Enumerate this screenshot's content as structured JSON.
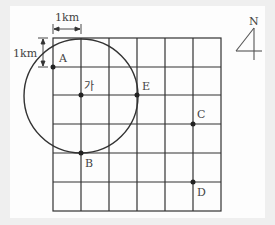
{
  "scale": {
    "horizontal_label": "1km",
    "vertical_label": "1km"
  },
  "compass": {
    "label": "N"
  },
  "grid": {
    "columns": 6,
    "rows": 6,
    "cell_km": 1
  },
  "points": [
    {
      "name": "A",
      "label": "A"
    },
    {
      "name": "ga",
      "label": "가"
    },
    {
      "name": "E",
      "label": "E"
    },
    {
      "name": "B",
      "label": "B"
    },
    {
      "name": "C",
      "label": "C"
    },
    {
      "name": "D",
      "label": "D"
    }
  ],
  "circle": {
    "center": "가",
    "radius_km": 2
  },
  "colors": {
    "line": "#333333",
    "text": "#444444",
    "background": "#fdfdfd"
  }
}
